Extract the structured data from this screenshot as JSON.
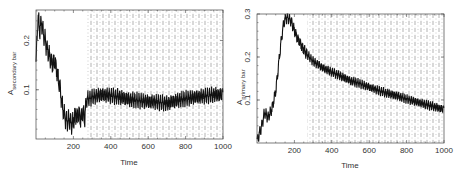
{
  "chart_data": [
    {
      "type": "line",
      "title": "",
      "xlabel": "Time",
      "ylabel": "A_secondary bar",
      "ylabel_main": "A",
      "ylabel_sub": "secondary bar",
      "xlim": [
        0,
        1000
      ],
      "ylim": [
        0.0,
        0.262
      ],
      "xticks": [
        200,
        400,
        600,
        800,
        1000
      ],
      "xtick_labels": [
        "200",
        "400",
        "600",
        "800",
        "1000"
      ],
      "yticks": [
        0.1,
        0.2
      ],
      "ytick_labels": [
        "0.1",
        "0.2"
      ],
      "grid": false,
      "shaded_region": {
        "x_start": 270,
        "x_end": 1000,
        "pattern": "dotted-dashed hatch"
      },
      "series": [
        {
          "name": "A_secondary bar",
          "x": [
            0,
            10,
            20,
            30,
            40,
            50,
            60,
            70,
            80,
            90,
            100,
            110,
            120,
            130,
            140,
            150,
            160,
            170,
            180,
            190,
            200,
            210,
            220,
            230,
            240,
            250,
            260,
            270,
            300,
            350,
            400,
            450,
            500,
            550,
            600,
            650,
            700,
            750,
            800,
            850,
            900,
            950,
            1000
          ],
          "values": [
            0.15,
            0.25,
            0.22,
            0.24,
            0.21,
            0.2,
            0.18,
            0.17,
            0.16,
            0.15,
            0.16,
            0.14,
            0.12,
            0.1,
            0.07,
            0.05,
            0.04,
            0.035,
            0.04,
            0.03,
            0.035,
            0.05,
            0.045,
            0.05,
            0.04,
            0.055,
            0.04,
            0.08,
            0.085,
            0.09,
            0.088,
            0.085,
            0.08,
            0.078,
            0.076,
            0.075,
            0.072,
            0.078,
            0.082,
            0.085,
            0.087,
            0.09,
            0.09
          ],
          "oscillation_amplitude_after_270": 0.012
        }
      ]
    },
    {
      "type": "line",
      "title": "",
      "xlabel": "Time",
      "ylabel": "A_primary bar",
      "ylabel_main": "A",
      "ylabel_sub": "primary bar",
      "xlim": [
        0,
        1000
      ],
      "ylim": [
        0.0,
        0.3
      ],
      "xticks": [
        200,
        400,
        600,
        800,
        1000
      ],
      "xtick_labels": [
        "200",
        "400",
        "600",
        "800",
        "1000"
      ],
      "yticks": [
        0.1,
        0.2,
        0.3
      ],
      "ytick_labels": [
        "0.1",
        "0.2",
        "0.3"
      ],
      "grid": false,
      "shaded_region": {
        "x_start": 270,
        "x_end": 1000,
        "pattern": "dotted-dashed hatch"
      },
      "series": [
        {
          "name": "A_primary bar",
          "x": [
            0,
            20,
            40,
            60,
            80,
            100,
            110,
            120,
            130,
            140,
            150,
            160,
            170,
            180,
            190,
            200,
            220,
            240,
            260,
            280,
            300,
            350,
            400,
            450,
            500,
            550,
            600,
            650,
            700,
            750,
            800,
            850,
            900,
            950,
            1000
          ],
          "values": [
            0.005,
            0.03,
            0.07,
            0.06,
            0.08,
            0.12,
            0.16,
            0.2,
            0.24,
            0.27,
            0.29,
            0.292,
            0.29,
            0.285,
            0.275,
            0.26,
            0.24,
            0.225,
            0.21,
            0.2,
            0.19,
            0.175,
            0.165,
            0.155,
            0.145,
            0.138,
            0.13,
            0.122,
            0.115,
            0.11,
            0.102,
            0.096,
            0.09,
            0.084,
            0.078
          ],
          "oscillation_amplitude_after_270": 0.008
        }
      ]
    }
  ]
}
